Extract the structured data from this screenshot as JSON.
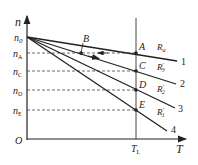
{
  "diagram": {
    "axes": {
      "y_label": "n",
      "x_label": "T",
      "origin_label": "O",
      "y_ticks": [
        {
          "main": "n",
          "sub": "0"
        },
        {
          "main": "n",
          "sub": "A"
        },
        {
          "main": "n",
          "sub": "C"
        },
        {
          "main": "n",
          "sub": "D"
        },
        {
          "main": "n",
          "sub": "E"
        }
      ],
      "x_tick": {
        "main": "T",
        "sub": "L"
      }
    },
    "points": {
      "A": "A",
      "B": "B",
      "C": "C",
      "D": "D",
      "E": "E"
    },
    "lines": [
      {
        "id": "1",
        "resistance": {
          "main": "R",
          "sub": "a"
        }
      },
      {
        "id": "2",
        "resistance": {
          "main": "R",
          "sub": "3",
          "prime": "′"
        }
      },
      {
        "id": "3",
        "resistance": {
          "main": "R",
          "sub": "2",
          "prime": "′"
        }
      },
      {
        "id": "4",
        "resistance": {
          "main": "R",
          "sub": "1",
          "prime": "′"
        }
      }
    ],
    "colors": {
      "stroke": "#222222",
      "background": "#ffffff"
    }
  }
}
